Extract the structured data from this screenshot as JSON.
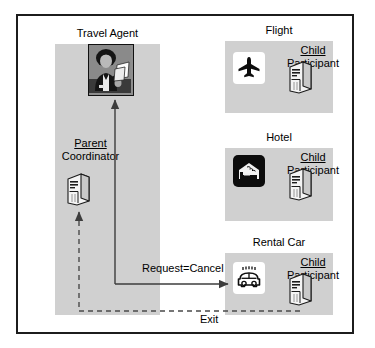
{
  "diagram": {
    "title_role_agent": "Travel Agent",
    "lifelines": [
      {
        "title": "Flight",
        "participant_role_underlined": "Child",
        "participant_role": "Participant",
        "icon": "airplane-icon"
      },
      {
        "title": "Hotel",
        "participant_role_underlined": "Child",
        "participant_role": "Participant",
        "icon": "hotel-bed-icon"
      },
      {
        "title": "Rental Car",
        "participant_role_underlined": "Child",
        "participant_role": "Participant",
        "icon": "car-icon"
      }
    ],
    "coordinator": {
      "role_underlined": "Parent",
      "role": "Coordinator",
      "icon": "server-tower-icon"
    },
    "agent": {
      "icon": "person-photo-icon"
    },
    "messages": [
      {
        "label": "Request=Cancel",
        "style": "solid-arrow"
      },
      {
        "label": "Exit",
        "style": "dashed-arrow"
      }
    ],
    "colors": {
      "panel_gray": "#d0d0d0",
      "border_black": "#1c1c1c",
      "line_gray": "#4a4a4a",
      "background": "#ffffff"
    }
  }
}
